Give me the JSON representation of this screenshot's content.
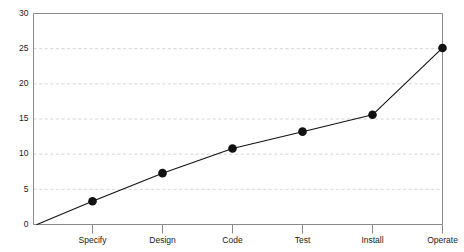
{
  "chart_data": {
    "type": "line",
    "title": "",
    "subtitle": "",
    "xlabel": "",
    "ylabel": "",
    "categories": [
      "Specify",
      "Design",
      "Code",
      "Test",
      "Install",
      "Operate"
    ],
    "values": [
      3.3,
      7.3,
      10.8,
      13.2,
      15.6,
      25.1
    ],
    "series": [
      {
        "name": "",
        "values": [
          3.3,
          7.3,
          10.8,
          13.2,
          15.6,
          25.1
        ]
      }
    ],
    "origin_value": 0,
    "ylim": [
      0,
      30
    ],
    "ytick_labels": [
      "0",
      "5",
      "10",
      "15",
      "20",
      "25",
      "30"
    ],
    "ytick_values": [
      0,
      5,
      10,
      15,
      20,
      25,
      30
    ],
    "grid": true,
    "grid_axis": "y",
    "grid_style": "dashed",
    "legend": false,
    "legend_position": "none",
    "marker": "filled-circle",
    "colors": {
      "line": "#111111",
      "marker": "#111111",
      "grid": "#c8c8d0",
      "frame": "#8a8a8a",
      "text": "#1a1a1a",
      "background": "#ffffff"
    }
  }
}
